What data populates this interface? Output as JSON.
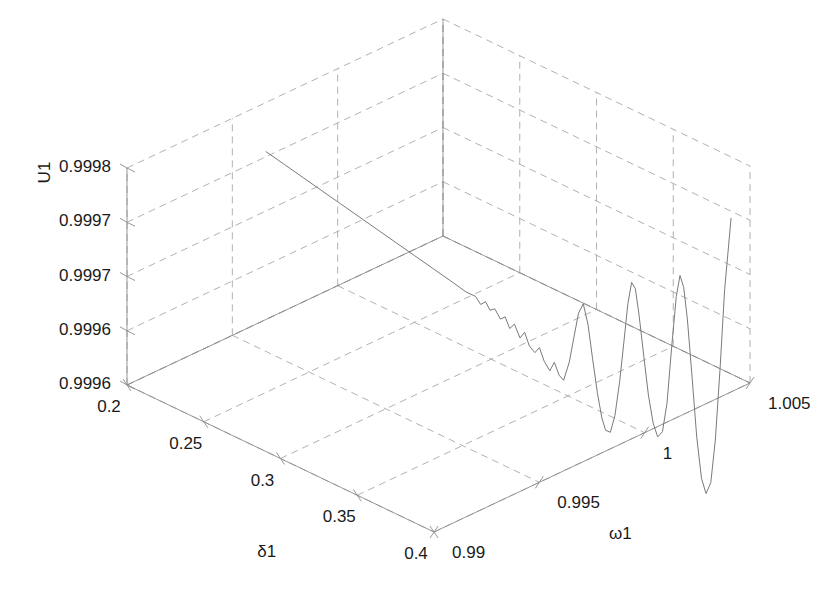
{
  "figure": {
    "kind": "matlab-3d-line-plot",
    "background_color": "#ffffff",
    "axis_line_color": "#8c8c8c",
    "grid_color": "#a8a8a8",
    "curve_color": "#7a7a7a",
    "text_color": "#1a1a1a"
  },
  "axes": {
    "x": {
      "label": "δ1",
      "ticks": [
        "0.2",
        "0.25",
        "0.3",
        "0.35",
        "0.4"
      ],
      "tick_values": [
        0.2,
        0.25,
        0.3,
        0.35,
        0.4
      ],
      "range": [
        0.2,
        0.4
      ]
    },
    "y": {
      "label": "ω1",
      "ticks": [
        "0.99",
        "0.995",
        "1",
        "1.005"
      ],
      "tick_values": [
        0.99,
        0.995,
        1.0,
        1.005
      ],
      "range": [
        0.99,
        1.005
      ]
    },
    "z": {
      "label": "U1",
      "ticks": [
        "0.9996",
        "0.9996",
        "0.9997",
        "0.9997",
        "0.9998"
      ],
      "tick_values": [
        0.99955,
        0.999625,
        0.9997,
        0.999775,
        0.99985
      ],
      "range": [
        0.99955,
        0.99985
      ]
    }
  },
  "chart_data": {
    "type": "line",
    "title": "",
    "xlabel": "δ1",
    "ylabel": "ω1",
    "zlabel": "U1",
    "xlim": [
      0.2,
      0.4
    ],
    "ylim": [
      0.99,
      1.005
    ],
    "zlim": [
      0.99955,
      0.99985
    ],
    "xticks": [
      0.2,
      0.25,
      0.3,
      0.35,
      0.4
    ],
    "yticks": [
      0.99,
      0.995,
      1.0,
      1.005
    ],
    "zticks": [
      0.99955,
      0.999625,
      0.9997,
      0.999775,
      0.99985
    ],
    "xtick_labels": [
      "0.2",
      "0.25",
      "0.3",
      "0.35",
      "0.4"
    ],
    "ytick_labels": [
      "0.99",
      "0.995",
      "1",
      "1.005"
    ],
    "ztick_labels": [
      "0.9996",
      "0.9996",
      "0.9997",
      "0.9997",
      "0.9998"
    ],
    "grid": true,
    "legend": null,
    "series": [
      {
        "name": "U1 trajectory",
        "comment": "Single 3D polyline; u is a normalized path parameter 0..1 mapping to the swept (delta1, omega1) diagonal; z is U1.",
        "points": [
          {
            "u": 0.0,
            "x": 0.2,
            "y": 0.9966,
            "z": 0.999782
          },
          {
            "u": 0.04,
            "x": 0.208,
            "y": 0.9969,
            "z": 0.999768
          },
          {
            "u": 0.08,
            "x": 0.216,
            "y": 0.9972,
            "z": 0.999754
          },
          {
            "u": 0.12,
            "x": 0.224,
            "y": 0.9975,
            "z": 0.99974
          },
          {
            "u": 0.16,
            "x": 0.232,
            "y": 0.9978,
            "z": 0.999726
          },
          {
            "u": 0.2,
            "x": 0.24,
            "y": 0.9981,
            "z": 0.999712
          },
          {
            "u": 0.24,
            "x": 0.248,
            "y": 0.9984,
            "z": 0.999698
          },
          {
            "u": 0.28,
            "x": 0.256,
            "y": 0.9987,
            "z": 0.999684
          },
          {
            "u": 0.32,
            "x": 0.264,
            "y": 0.999,
            "z": 0.99967
          },
          {
            "u": 0.36,
            "x": 0.272,
            "y": 0.9993,
            "z": 0.999656
          },
          {
            "u": 0.4,
            "x": 0.28,
            "y": 0.9996,
            "z": 0.999642
          },
          {
            "u": 0.43,
            "x": 0.286,
            "y": 0.99983,
            "z": 0.999631
          },
          {
            "u": 0.45,
            "x": 0.29,
            "y": 0.99998,
            "z": 0.999627
          },
          {
            "u": 0.462,
            "x": 0.2924,
            "y": 1.00006,
            "z": 0.999617
          },
          {
            "u": 0.472,
            "x": 0.2944,
            "y": 1.00014,
            "z": 0.999622
          },
          {
            "u": 0.482,
            "x": 0.2964,
            "y": 1.00021,
            "z": 0.999611
          },
          {
            "u": 0.492,
            "x": 0.2984,
            "y": 1.00029,
            "z": 0.999614
          },
          {
            "u": 0.504,
            "x": 0.3008,
            "y": 1.00038,
            "z": 0.999601
          },
          {
            "u": 0.514,
            "x": 0.3028,
            "y": 1.00046,
            "z": 0.999605
          },
          {
            "u": 0.524,
            "x": 0.3048,
            "y": 1.00053,
            "z": 0.99959
          },
          {
            "u": 0.534,
            "x": 0.3068,
            "y": 1.00061,
            "z": 0.999597
          },
          {
            "u": 0.546,
            "x": 0.3092,
            "y": 1.0007,
            "z": 0.999579
          },
          {
            "u": 0.556,
            "x": 0.3112,
            "y": 1.00077,
            "z": 0.999588
          },
          {
            "u": 0.566,
            "x": 0.3132,
            "y": 1.00085,
            "z": 0.99957
          },
          {
            "u": 0.578,
            "x": 0.3156,
            "y": 1.00094,
            "z": 0.999562
          },
          {
            "u": 0.588,
            "x": 0.3176,
            "y": 1.00101,
            "z": 0.99957
          },
          {
            "u": 0.598,
            "x": 0.3196,
            "y": 1.00109,
            "z": 0.999552
          },
          {
            "u": 0.61,
            "x": 0.322,
            "y": 1.00118,
            "z": 0.99954
          },
          {
            "u": 0.62,
            "x": 0.324,
            "y": 1.00125,
            "z": 0.999553
          },
          {
            "u": 0.63,
            "x": 0.326,
            "y": 1.00133,
            "z": 0.999536
          },
          {
            "u": 0.64,
            "x": 0.328,
            "y": 1.0014,
            "z": 0.99953
          },
          {
            "u": 0.652,
            "x": 0.3304,
            "y": 1.00149,
            "z": 0.999556
          },
          {
            "u": 0.662,
            "x": 0.3324,
            "y": 1.00157,
            "z": 0.999592
          },
          {
            "u": 0.672,
            "x": 0.3344,
            "y": 1.00164,
            "z": 0.999626
          },
          {
            "u": 0.682,
            "x": 0.3364,
            "y": 1.00172,
            "z": 0.99964
          },
          {
            "u": 0.692,
            "x": 0.3384,
            "y": 1.0018,
            "z": 0.999612
          },
          {
            "u": 0.702,
            "x": 0.3404,
            "y": 1.00187,
            "z": 0.999566
          },
          {
            "u": 0.712,
            "x": 0.3424,
            "y": 1.00195,
            "z": 0.99952
          },
          {
            "u": 0.722,
            "x": 0.3444,
            "y": 1.00202,
            "z": 0.999486
          },
          {
            "u": 0.73,
            "x": 0.346,
            "y": 1.00208,
            "z": 0.99947
          },
          {
            "u": 0.74,
            "x": 0.348,
            "y": 1.00216,
            "z": 0.999468
          },
          {
            "u": 0.75,
            "x": 0.35,
            "y": 1.00223,
            "z": 0.999492
          },
          {
            "u": 0.76,
            "x": 0.352,
            "y": 1.00231,
            "z": 0.99954
          },
          {
            "u": 0.77,
            "x": 0.354,
            "y": 1.00238,
            "z": 0.9996
          },
          {
            "u": 0.778,
            "x": 0.3556,
            "y": 1.00244,
            "z": 0.99965
          },
          {
            "u": 0.786,
            "x": 0.3572,
            "y": 1.0025,
            "z": 0.99968
          },
          {
            "u": 0.794,
            "x": 0.3588,
            "y": 1.00256,
            "z": 0.999672
          },
          {
            "u": 0.802,
            "x": 0.3604,
            "y": 1.00262,
            "z": 0.999636
          },
          {
            "u": 0.812,
            "x": 0.3624,
            "y": 1.0027,
            "z": 0.99958
          },
          {
            "u": 0.822,
            "x": 0.3644,
            "y": 1.00277,
            "z": 0.999528
          },
          {
            "u": 0.832,
            "x": 0.3664,
            "y": 1.00285,
            "z": 0.99949
          },
          {
            "u": 0.842,
            "x": 0.3684,
            "y": 1.00292,
            "z": 0.999472
          },
          {
            "u": 0.852,
            "x": 0.3704,
            "y": 1.003,
            "z": 0.99948
          },
          {
            "u": 0.862,
            "x": 0.3724,
            "y": 1.00307,
            "z": 0.99952
          },
          {
            "u": 0.872,
            "x": 0.3744,
            "y": 1.00315,
            "z": 0.9996
          },
          {
            "u": 0.882,
            "x": 0.3764,
            "y": 1.00322,
            "z": 0.99967
          },
          {
            "u": 0.89,
            "x": 0.378,
            "y": 1.00328,
            "z": 0.9997
          },
          {
            "u": 0.898,
            "x": 0.3796,
            "y": 1.00334,
            "z": 0.999684
          },
          {
            "u": 0.906,
            "x": 0.3812,
            "y": 1.0034,
            "z": 0.99964
          },
          {
            "u": 0.916,
            "x": 0.3832,
            "y": 1.00348,
            "z": 0.99956
          },
          {
            "u": 0.926,
            "x": 0.3852,
            "y": 1.00355,
            "z": 0.99948
          },
          {
            "u": 0.936,
            "x": 0.3872,
            "y": 1.00363,
            "z": 0.999424
          },
          {
            "u": 0.946,
            "x": 0.3892,
            "y": 1.0037,
            "z": 0.999404
          },
          {
            "u": 0.956,
            "x": 0.3912,
            "y": 1.00378,
            "z": 0.99942
          },
          {
            "u": 0.966,
            "x": 0.3932,
            "y": 1.00385,
            "z": 0.99948
          },
          {
            "u": 0.976,
            "x": 0.3952,
            "y": 1.00393,
            "z": 0.99958
          },
          {
            "u": 0.986,
            "x": 0.3972,
            "y": 1.004,
            "z": 0.99969
          },
          {
            "u": 1.0,
            "x": 0.4,
            "y": 1.0041,
            "z": 0.99979
          }
        ]
      }
    ]
  }
}
